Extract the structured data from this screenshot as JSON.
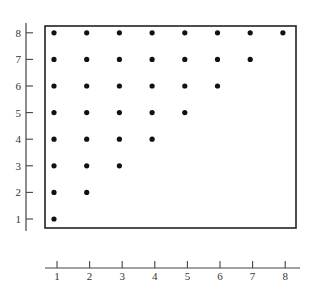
{
  "chart_data": {
    "type": "scatter",
    "title": "",
    "xlabel": "",
    "ylabel": "",
    "xlim": [
      1,
      8
    ],
    "ylim": [
      1,
      8
    ],
    "grid": false,
    "legend": null,
    "x_ticks": [
      "1",
      "2",
      "3",
      "4",
      "5",
      "6",
      "7",
      "8"
    ],
    "y_ticks": [
      "1",
      "2",
      "3",
      "4",
      "5",
      "6",
      "7",
      "8"
    ],
    "points": [
      {
        "x": 1,
        "y": 1
      },
      {
        "x": 1,
        "y": 2
      },
      {
        "x": 2,
        "y": 2
      },
      {
        "x": 1,
        "y": 3
      },
      {
        "x": 2,
        "y": 3
      },
      {
        "x": 3,
        "y": 3
      },
      {
        "x": 1,
        "y": 4
      },
      {
        "x": 2,
        "y": 4
      },
      {
        "x": 3,
        "y": 4
      },
      {
        "x": 4,
        "y": 4
      },
      {
        "x": 1,
        "y": 5
      },
      {
        "x": 2,
        "y": 5
      },
      {
        "x": 3,
        "y": 5
      },
      {
        "x": 4,
        "y": 5
      },
      {
        "x": 5,
        "y": 5
      },
      {
        "x": 1,
        "y": 6
      },
      {
        "x": 2,
        "y": 6
      },
      {
        "x": 3,
        "y": 6
      },
      {
        "x": 4,
        "y": 6
      },
      {
        "x": 5,
        "y": 6
      },
      {
        "x": 6,
        "y": 6
      },
      {
        "x": 1,
        "y": 7
      },
      {
        "x": 2,
        "y": 7
      },
      {
        "x": 3,
        "y": 7
      },
      {
        "x": 4,
        "y": 7
      },
      {
        "x": 5,
        "y": 7
      },
      {
        "x": 6,
        "y": 7
      },
      {
        "x": 7,
        "y": 7
      },
      {
        "x": 1,
        "y": 8
      },
      {
        "x": 2,
        "y": 8
      },
      {
        "x": 3,
        "y": 8
      },
      {
        "x": 4,
        "y": 8
      },
      {
        "x": 5,
        "y": 8
      },
      {
        "x": 6,
        "y": 8
      },
      {
        "x": 7,
        "y": 8
      },
      {
        "x": 8,
        "y": 8
      }
    ],
    "annotations": "Lower-triangular lattice of points (x <= y) inside a framed box; separate y-axis at left and x-axis below."
  },
  "colors": {
    "point": "#111111",
    "axis": "#444444",
    "frame": "#222222",
    "label": "#333333"
  }
}
